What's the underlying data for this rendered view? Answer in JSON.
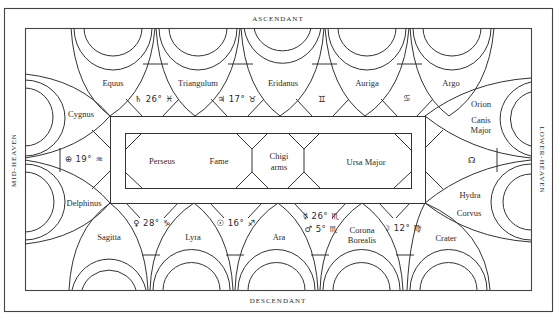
{
  "diagram": {
    "edges": {
      "top": "ASCENDANT",
      "bottom": "DESCENDANT",
      "left": "MID-HEAVEN",
      "right": "LOWER-HEAVEN"
    },
    "top_row": {
      "constellations": [
        "Equus",
        "Triangulum",
        "Eridanus",
        "Auriga",
        "Argo"
      ],
      "planets": [
        {
          "symbol": "♄ 26° ♓",
          "name": "saturn-in-pisces"
        },
        {
          "symbol": "♃ 17° ♉",
          "name": "jupiter-in-taurus"
        },
        {
          "symbol": "♊",
          "name": "gemini"
        },
        {
          "symbol": "♋",
          "name": "cancer"
        }
      ]
    },
    "bottom_row": {
      "constellations": [
        "Sagitta",
        "Lyra",
        "Ara",
        "Corona Borealis",
        "Crater"
      ],
      "corona_line1": "Corona",
      "corona_line2": "Borealis",
      "planets": [
        {
          "symbol": "♀ 28° ♑",
          "name": "venus-in-capricorn"
        },
        {
          "symbol": "☉ 16° ♐",
          "name": "sun-in-sagittarius"
        },
        {
          "symbol": "☿ 26° ♏",
          "name": "mercury-in-scorpio"
        },
        {
          "symbol": "♂   5° ♏",
          "name": "mars-in-scorpio"
        },
        {
          "symbol": "☽ 12° ♍",
          "name": "moon-in-virgo"
        }
      ]
    },
    "left_side": {
      "upper": "Cygnus",
      "lower": "Delphinus",
      "planet": "⊕ 19° ♒"
    },
    "right_side": {
      "upper1": "Orion",
      "upper2_line1": "Canis",
      "upper2_line2": "Major",
      "lower1": "Hydra",
      "lower2": "Corvus",
      "node": "☊"
    },
    "center": {
      "left1": "Perseus",
      "left2": "Fame",
      "middle_line1": "Chigi",
      "middle_line2": "arms",
      "right": "Ursa Major"
    }
  }
}
